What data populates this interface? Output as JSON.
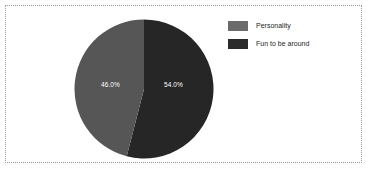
{
  "chart_data": {
    "type": "pie",
    "title": "",
    "categories": [
      "Personality",
      "Fun to be around"
    ],
    "values": [
      46.0,
      54.0
    ],
    "labels": [
      "46.0%",
      "54.0%"
    ],
    "colors": [
      "#565656",
      "#262626"
    ],
    "legend_position": "right",
    "grid": false,
    "start_angle_deg": 0,
    "direction": "clockwise",
    "slices": [
      {
        "name": "Personality",
        "value": 46.0,
        "label": "46.0%",
        "color": "#565656"
      },
      {
        "name": "Fun to be around",
        "value": 54.0,
        "label": "54.0%",
        "color": "#262626"
      }
    ]
  },
  "legend": {
    "items": [
      {
        "label": "Personality",
        "color": "#6b6b6b"
      },
      {
        "label": "Fun to be around",
        "color": "#2b2b2b"
      }
    ]
  },
  "frame": {
    "border_color": "#9a9a9a",
    "background": "#ffffff"
  }
}
